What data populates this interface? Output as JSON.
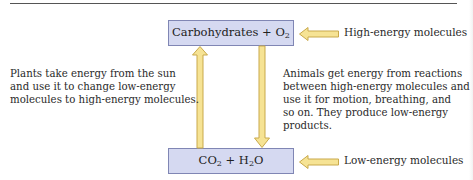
{
  "diagram": {
    "top_box": {
      "text": "Carbohydrates + O",
      "subscript": "2"
    },
    "bottom_box": {
      "part1": "CO",
      "sub1": "2",
      "part2": " + H",
      "sub2": "2",
      "part3": "O"
    },
    "labels": {
      "high": "High-energy molecules",
      "low": "Low-energy molecules"
    },
    "plants_text": [
      "Plants take energy from the sun",
      "and use it to change low-energy",
      "molecules to high-energy molecules."
    ],
    "animals_text": [
      "Animals get energy from reactions",
      "between high-energy molecules and",
      "use it for motion, breathing, and",
      "so on. They produce low-energy",
      "products."
    ],
    "colors": {
      "box_fill": "#d5d9f1",
      "box_border": "#8086b4",
      "arrow_fill": "#f6e394",
      "arrow_border": "#c9a94a"
    }
  }
}
